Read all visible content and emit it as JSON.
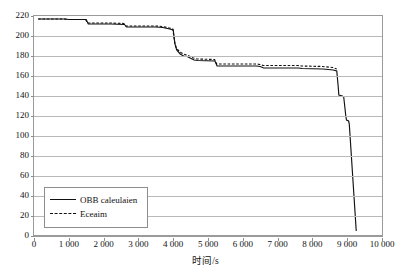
{
  "chart_data": {
    "type": "line",
    "title": "",
    "xlabel": "时间/s",
    "ylabel": "",
    "xlim": [
      0,
      10000
    ],
    "ylim": [
      0,
      220
    ],
    "grid": "horizontal",
    "legend_position": "bottom-left",
    "x_ticks": [
      "0",
      "1 000",
      "2 000",
      "3 000",
      "4 000",
      "5 000",
      "6 000",
      "7 000",
      "8 000",
      "9 000",
      "10 000"
    ],
    "x_tick_values": [
      0,
      1000,
      2000,
      3000,
      4000,
      5000,
      6000,
      7000,
      8000,
      9000,
      10000
    ],
    "y_ticks": [
      "0",
      "20",
      "40",
      "60",
      "80",
      "100",
      "120",
      "140",
      "160",
      "180",
      "200",
      "220"
    ],
    "y_tick_values": [
      0,
      20,
      40,
      60,
      80,
      100,
      120,
      140,
      160,
      180,
      200,
      220
    ],
    "series": [
      {
        "name": "OBB caleulaien",
        "style": "solid",
        "color": "#111111",
        "points": [
          [
            120,
            217
          ],
          [
            900,
            217
          ],
          [
            1000,
            216.5
          ],
          [
            1500,
            216.5
          ],
          [
            1560,
            212
          ],
          [
            2150,
            212
          ],
          [
            2200,
            212
          ],
          [
            2600,
            211.5
          ],
          [
            2660,
            209
          ],
          [
            3500,
            209
          ],
          [
            3700,
            208.5
          ],
          [
            3900,
            207
          ],
          [
            4000,
            206
          ],
          [
            4050,
            192
          ],
          [
            4100,
            186
          ],
          [
            4200,
            182
          ],
          [
            4300,
            180
          ],
          [
            4400,
            179.5
          ],
          [
            4600,
            176
          ],
          [
            4700,
            175.5
          ],
          [
            5200,
            175
          ],
          [
            5260,
            170
          ],
          [
            6400,
            170
          ],
          [
            6500,
            169.5
          ],
          [
            6600,
            168
          ],
          [
            7600,
            168
          ],
          [
            7700,
            167.5
          ],
          [
            8300,
            167
          ],
          [
            8600,
            166
          ],
          [
            8700,
            165
          ],
          [
            8740,
            150
          ],
          [
            8760,
            141
          ],
          [
            8860,
            140
          ],
          [
            8900,
            139
          ],
          [
            8960,
            120
          ],
          [
            8980,
            116
          ],
          [
            9040,
            115
          ],
          [
            9060,
            112
          ],
          [
            9260,
            5
          ]
        ]
      },
      {
        "name": "Eceaim",
        "style": "dashed",
        "color": "#111111",
        "points": [
          [
            120,
            217
          ],
          [
            860,
            217
          ],
          [
            960,
            216.5
          ],
          [
            1480,
            216.5
          ],
          [
            1540,
            213
          ],
          [
            2130,
            213
          ],
          [
            2200,
            213
          ],
          [
            2580,
            212.5
          ],
          [
            2640,
            210
          ],
          [
            3480,
            210
          ],
          [
            3700,
            209.5
          ],
          [
            3880,
            208
          ],
          [
            3990,
            207
          ],
          [
            4040,
            194
          ],
          [
            4090,
            188
          ],
          [
            4190,
            184
          ],
          [
            4290,
            182
          ],
          [
            4390,
            181
          ],
          [
            4580,
            178
          ],
          [
            4690,
            177
          ],
          [
            5190,
            176.5
          ],
          [
            5250,
            172
          ],
          [
            6390,
            172
          ],
          [
            6490,
            171.5
          ],
          [
            6590,
            170.5
          ],
          [
            7590,
            170.5
          ],
          [
            7690,
            170
          ],
          [
            8290,
            169.5
          ],
          [
            8590,
            168.5
          ],
          [
            8700,
            167
          ]
        ]
      }
    ]
  },
  "legend": {
    "items": [
      {
        "label": "OBB caleulaien",
        "style": "solid"
      },
      {
        "label": "Eceaim",
        "style": "dashed"
      }
    ]
  }
}
